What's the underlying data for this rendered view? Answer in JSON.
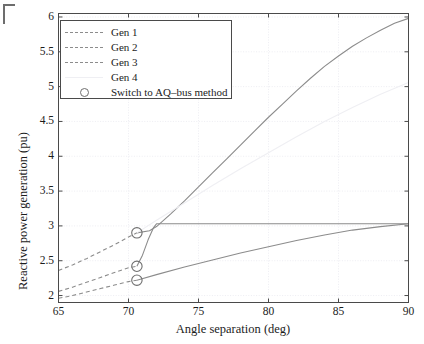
{
  "figure": {
    "background": "#ffffff",
    "axis_color": "#4a4a4a",
    "grid_color": "#e9e9ef",
    "text_color": "#1c1c1c"
  },
  "axes": {
    "x_title": "Angle separation (deg)",
    "y_title": "Reactive power generation (pu)",
    "x_ticks": [
      "65",
      "70",
      "75",
      "80",
      "85",
      "90"
    ],
    "y_ticks": [
      "2",
      "2.5",
      "3",
      "3.5",
      "4",
      "4.5",
      "5",
      "5.5",
      "6"
    ]
  },
  "legend": {
    "items": [
      {
        "label": "Gen 1",
        "style": "dashed",
        "color": "#8c8c8c",
        "marker": "none"
      },
      {
        "label": "Gen 2",
        "style": "dashed",
        "color": "#8c8c8c",
        "marker": "none"
      },
      {
        "label": "Gen 3",
        "style": "dashed",
        "color": "#8c8c8c",
        "marker": "none"
      },
      {
        "label": "Gen 4",
        "style": "solid",
        "color": "#efeff3",
        "marker": "none"
      },
      {
        "label": "Switch to AQ–bus method",
        "style": "none",
        "color": "#6f6f6f",
        "marker": "circle"
      }
    ]
  },
  "chart_data": {
    "type": "line",
    "title": "",
    "xlabel": "Angle separation (deg)",
    "ylabel": "Reactive power generation (pu)",
    "xlim": [
      65,
      90
    ],
    "ylim": [
      1.9,
      6.05
    ],
    "xticks": [
      65,
      70,
      75,
      80,
      85,
      90
    ],
    "yticks": [
      2,
      2.5,
      3,
      3.5,
      4,
      4.5,
      5,
      5.5,
      6
    ],
    "grid": true,
    "legend_position": "upper left",
    "switch_angle": 70.6,
    "annotations": [
      {
        "text": "Switch to AQ–bus method",
        "marker": "circle",
        "x": 70.6,
        "y": 2.9
      },
      {
        "text": "Switch to AQ–bus method",
        "marker": "circle",
        "x": 70.6,
        "y": 2.42
      },
      {
        "text": "Switch to AQ–bus method",
        "marker": "circle",
        "x": 70.6,
        "y": 2.22
      }
    ],
    "series": [
      {
        "name": "Gen 1",
        "color": "#8c8c8c",
        "dashed_segment": {
          "x": [
            65,
            66,
            67,
            68,
            69,
            70,
            70.6
          ],
          "y": [
            2.36,
            2.44,
            2.53,
            2.63,
            2.73,
            2.84,
            2.9
          ]
        },
        "solid_segment": {
          "x": [
            70.6,
            71.5,
            72,
            73,
            74,
            75,
            76,
            77,
            78,
            79,
            80,
            81,
            82,
            83,
            84,
            85,
            86,
            87,
            88,
            89,
            90
          ],
          "y": [
            2.9,
            2.93,
            2.99,
            3.17,
            3.36,
            3.56,
            3.76,
            3.96,
            4.16,
            4.36,
            4.56,
            4.75,
            4.94,
            5.12,
            5.29,
            5.44,
            5.58,
            5.7,
            5.81,
            5.91,
            5.98
          ]
        }
      },
      {
        "name": "Gen 2",
        "color": "#8c8c8c",
        "dashed_segment": {
          "x": [
            65,
            66,
            67,
            68,
            69,
            70,
            70.6
          ],
          "y": [
            2.06,
            2.12,
            2.19,
            2.26,
            2.33,
            2.4,
            2.42
          ]
        },
        "solid_segment": {
          "x": [
            70.6,
            71.0,
            71.4,
            71.8,
            72.0,
            75,
            80,
            85,
            90
          ],
          "y": [
            2.42,
            2.58,
            2.8,
            2.98,
            3.03,
            3.03,
            3.03,
            3.03,
            3.03
          ]
        }
      },
      {
        "name": "Gen 3",
        "color": "#8c8c8c",
        "dashed_segment": {
          "x": [
            65,
            66,
            67,
            68,
            69,
            70,
            70.6
          ],
          "y": [
            1.96,
            2.0,
            2.05,
            2.1,
            2.15,
            2.2,
            2.22
          ]
        },
        "solid_segment": {
          "x": [
            70.6,
            72,
            74,
            76,
            78,
            80,
            82,
            84,
            86,
            88,
            90
          ],
          "y": [
            2.22,
            2.3,
            2.41,
            2.51,
            2.61,
            2.7,
            2.79,
            2.87,
            2.94,
            2.99,
            3.03
          ]
        }
      },
      {
        "name": "Gen 4",
        "color": "#efeff3",
        "dashed_segment": {
          "x": [],
          "y": []
        },
        "solid_segment": {
          "x": [
            70.6,
            72,
            74,
            76,
            78,
            80,
            82,
            84,
            86,
            88,
            90
          ],
          "y": [
            2.9,
            3.08,
            3.33,
            3.58,
            3.82,
            4.05,
            4.28,
            4.5,
            4.7,
            4.89,
            5.06
          ]
        }
      }
    ]
  }
}
